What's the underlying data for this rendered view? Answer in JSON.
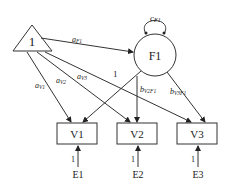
{
  "diagram": {
    "constant": {
      "label": "1"
    },
    "factor": {
      "label": "F1",
      "variance": "c",
      "variance_sub": "F1"
    },
    "observed": [
      {
        "label": "V1"
      },
      {
        "label": "V2"
      },
      {
        "label": "V3"
      }
    ],
    "errors": [
      {
        "label": "E1",
        "loading": "1"
      },
      {
        "label": "E2",
        "loading": "1"
      },
      {
        "label": "E3",
        "loading": "1"
      }
    ],
    "paths": {
      "aF1": {
        "base": "a",
        "sub": "F1"
      },
      "aV1": {
        "base": "a",
        "sub": "V1"
      },
      "aV2": {
        "base": "a",
        "sub": "V2"
      },
      "aV3": {
        "base": "a",
        "sub": "V3"
      },
      "F1_V1": {
        "label": "1"
      },
      "bV2F1": {
        "base": "b",
        "sub": "V2F1"
      },
      "bV3F1": {
        "base": "b",
        "sub": "V3F1"
      }
    }
  }
}
